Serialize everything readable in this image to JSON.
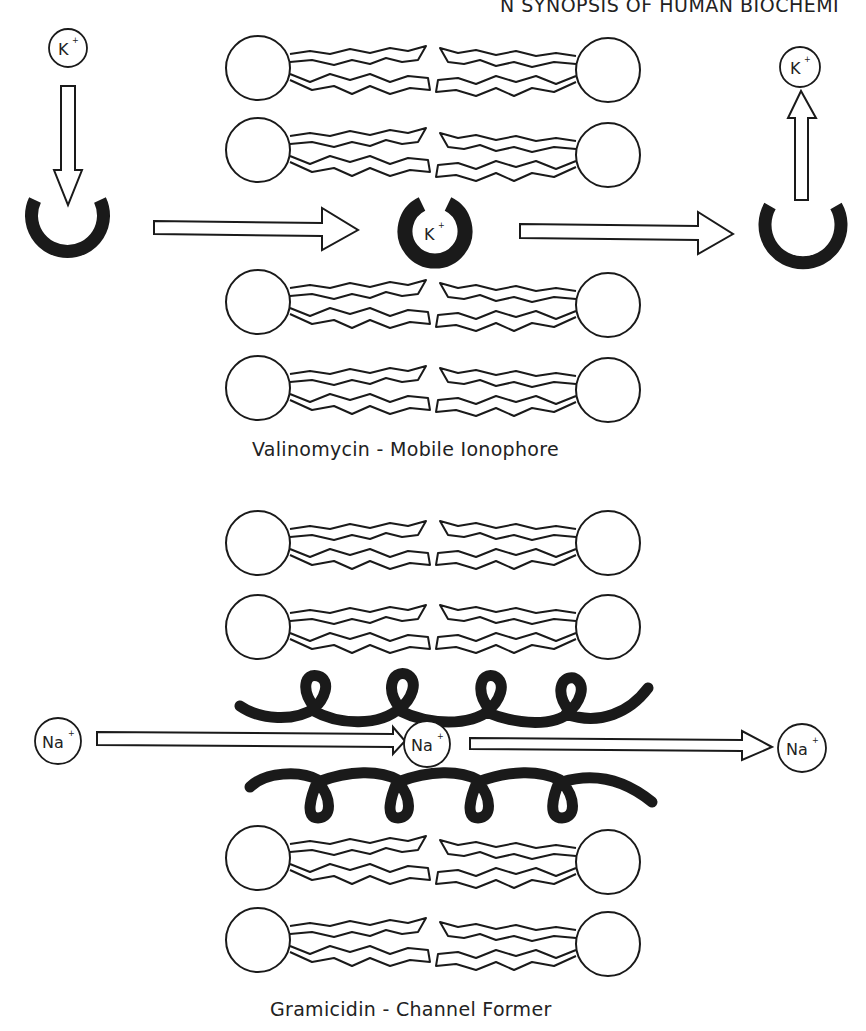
{
  "header": {
    "running_head": "N SYNOPSIS OF HUMAN BIOCHEMI"
  },
  "diagrams": [
    {
      "id": "valinomycin",
      "caption": "Valinomycin  -  Mobile Ionophore",
      "ion": "K",
      "ion_charge": "+",
      "steps": [
        "K+ binds open carrier",
        "carrier with bound K+ crosses membrane",
        "K+ released on other side"
      ]
    },
    {
      "id": "gramicidin",
      "caption": "Gramicidin  -  Channel Former",
      "ion": "Na",
      "ion_charge": "+",
      "steps": [
        "Na+ enters channel",
        "Na+ passes through helical channel",
        "Na+ exits on other side"
      ]
    }
  ],
  "colors": {
    "ink": "#1a1a1a",
    "paper": "#ffffff"
  }
}
